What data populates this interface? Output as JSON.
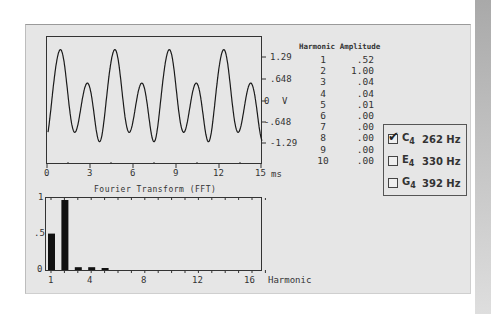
{
  "waveform": {
    "y_ticks": [
      "1.29",
      ".648",
      "0",
      "-.648",
      "-1.29"
    ],
    "y_unit": "V",
    "x_ticks": [
      "0",
      "3",
      "6",
      "9",
      "12",
      "15"
    ],
    "x_unit": "ms"
  },
  "fft": {
    "title": "Fourier Transform  (FFT)",
    "y_ticks": [
      "1",
      ".5",
      "0"
    ],
    "x_ticks": [
      "1",
      "4",
      "8",
      "12",
      "16"
    ],
    "x_label": "Harmonic"
  },
  "table": {
    "headers": [
      "Harmonic",
      "Amplitude"
    ],
    "rows": [
      {
        "harmonic": "1",
        "amplitude": ".52"
      },
      {
        "harmonic": "2",
        "amplitude": "1.00"
      },
      {
        "harmonic": "3",
        "amplitude": ".04"
      },
      {
        "harmonic": "4",
        "amplitude": ".04"
      },
      {
        "harmonic": "5",
        "amplitude": ".01"
      },
      {
        "harmonic": "6",
        "amplitude": ".00"
      },
      {
        "harmonic": "7",
        "amplitude": ".00"
      },
      {
        "harmonic": "8",
        "amplitude": ".00"
      },
      {
        "harmonic": "9",
        "amplitude": ".00"
      },
      {
        "harmonic": "10",
        "amplitude": ".00"
      }
    ]
  },
  "legend": {
    "items": [
      {
        "note": "C",
        "octave": "4",
        "freq": "262 Hz",
        "checked": true
      },
      {
        "note": "E",
        "octave": "4",
        "freq": "330 Hz",
        "checked": false
      },
      {
        "note": "G",
        "octave": "4",
        "freq": "392 Hz",
        "checked": false
      }
    ]
  },
  "chart_data": [
    {
      "type": "line",
      "title": "",
      "xlabel": "ms",
      "ylabel": "V",
      "xlim": [
        0,
        15
      ],
      "ylim": [
        -1.29,
        1.29
      ],
      "y_ticks": [
        1.29,
        0.648,
        0,
        -0.648,
        -1.29
      ],
      "x_ticks": [
        0,
        3,
        6,
        9,
        12,
        15
      ],
      "description": "Composite waveform of harmonics 1 and 2 (C4 262 Hz fundamental)"
    },
    {
      "type": "bar",
      "title": "Fourier Transform  (FFT)",
      "xlabel": "Harmonic",
      "ylabel": "",
      "categories": [
        1,
        2,
        3,
        4,
        5,
        6,
        7,
        8,
        9,
        10,
        11,
        12,
        13,
        14,
        15,
        16
      ],
      "values": [
        0.52,
        1.0,
        0.04,
        0.04,
        0.01,
        0,
        0,
        0,
        0,
        0,
        0,
        0,
        0,
        0,
        0,
        0
      ],
      "ylim": [
        0,
        1
      ],
      "x_ticks": [
        1,
        4,
        8,
        12,
        16
      ],
      "y_ticks": [
        0,
        0.5,
        1
      ]
    }
  ]
}
